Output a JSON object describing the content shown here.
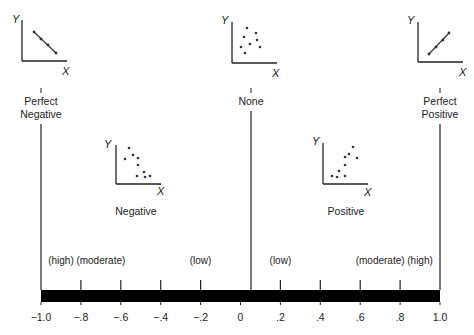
{
  "axis": {
    "min": -1.0,
    "max": 1.0,
    "tick_values": [
      -1.0,
      -0.8,
      -0.6,
      -0.4,
      -0.2,
      0,
      0.2,
      0.4,
      0.6,
      0.8,
      1.0
    ],
    "tick_labels": [
      "−1.0",
      "−.8",
      "−.6",
      "−.4",
      "−.2",
      "0",
      ".2",
      ".4",
      ".6",
      ".8",
      "1.0"
    ]
  },
  "strength_labels": [
    {
      "text": "(high)",
      "at": -0.9
    },
    {
      "text": "(moderate)",
      "at": -0.7
    },
    {
      "text": "(low)",
      "at": -0.2
    },
    {
      "text": "(low)",
      "at": 0.2
    },
    {
      "text": "(moderate)",
      "at": 0.7
    },
    {
      "text": "(high)",
      "at": 0.9
    }
  ],
  "categories": {
    "perfect_negative": {
      "line1": "Perfect",
      "line2": "Negative",
      "at": -1.0
    },
    "negative": {
      "label": "Negative",
      "at": -0.6
    },
    "none": {
      "label": "None",
      "at": 0
    },
    "positive": {
      "label": "Positive",
      "at": 0.6
    },
    "perfect_positive": {
      "line1": "Perfect",
      "line2": "Positive",
      "at": 1.0
    }
  },
  "plot_axes": {
    "x": "X",
    "y": "Y"
  }
}
